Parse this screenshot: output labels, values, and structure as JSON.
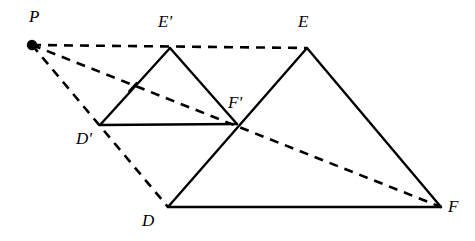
{
  "figure": {
    "background_color": "#ffffff",
    "stroke_color": "#000000",
    "width": 475,
    "height": 241
  },
  "points": {
    "P": {
      "label": "P",
      "x": 32,
      "y": 45,
      "label_x": 29,
      "label_y": 8,
      "has_dot": true
    },
    "Dprime": {
      "label": "D'",
      "x": 100,
      "y": 125,
      "label_x": 76,
      "label_y": 130,
      "has_dot": false
    },
    "Eprime": {
      "label": "E'",
      "x": 170,
      "y": 48,
      "label_x": 158,
      "label_y": 13,
      "has_dot": false
    },
    "Fprime": {
      "label": "F'",
      "x": 237,
      "y": 124,
      "label_x": 228,
      "label_y": 94,
      "has_dot": false
    },
    "D": {
      "label": "D",
      "x": 168,
      "y": 207,
      "label_x": 142,
      "label_y": 212,
      "has_dot": false
    },
    "E": {
      "label": "E",
      "x": 307,
      "y": 48,
      "label_x": 298,
      "label_y": 13,
      "has_dot": false
    },
    "F": {
      "label": "F",
      "x": 441,
      "y": 207,
      "label_x": 448,
      "label_y": 198,
      "has_dot": false
    }
  },
  "solid_edges": [
    {
      "name": "edge-Dprime-Eprime",
      "x1": 100,
      "y1": 125,
      "x2": 170,
      "y2": 48
    },
    {
      "name": "edge-Eprime-Fprime",
      "x1": 170,
      "y1": 48,
      "x2": 237,
      "y2": 124
    },
    {
      "name": "edge-Dprime-Fprime",
      "x1": 100,
      "y1": 125,
      "x2": 237,
      "y2": 124
    },
    {
      "name": "edge-D-E",
      "x1": 168,
      "y1": 207,
      "x2": 307,
      "y2": 48
    },
    {
      "name": "edge-E-F",
      "x1": 307,
      "y1": 48,
      "x2": 441,
      "y2": 207
    },
    {
      "name": "edge-D-F",
      "x1": 168,
      "y1": 207,
      "x2": 441,
      "y2": 207
    }
  ],
  "dashed_rays": [
    {
      "name": "ray-P-Eprime-E",
      "x1": 32,
      "y1": 45,
      "x2": 307,
      "y2": 48
    },
    {
      "name": "ray-P-Fprime-F",
      "x1": 32,
      "y1": 45,
      "x2": 441,
      "y2": 207
    },
    {
      "name": "ray-P-Dprime-D",
      "x1": 32,
      "y1": 45,
      "x2": 168,
      "y2": 207
    }
  ],
  "tick_marks": [
    {
      "name": "tick-on-Dprime-Eprime",
      "x": 133,
      "y": 87,
      "angle_deg": -47.7,
      "length": 11
    }
  ],
  "style": {
    "solid_stroke_width": 2.4,
    "dashed_stroke_width": 2.6,
    "dash_pattern": "9,7",
    "tick_stroke_width": 2.2,
    "point_dot_radius": 5.2
  }
}
